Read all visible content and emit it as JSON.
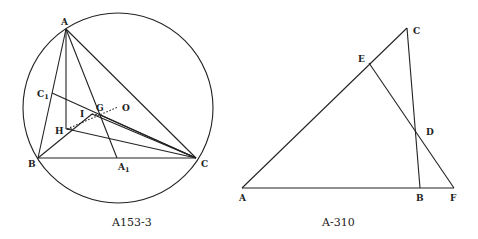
{
  "figures": [
    {
      "caption": "A153-3",
      "description": "Triangle ABC inscribed in circle with orthocenter H, incenter I, centroid G, circumcenter O, and cevians A-A1, C-C1",
      "circle": {
        "cx": 118,
        "cy": 108,
        "r": 95
      },
      "points": {
        "A": {
          "label": "A",
          "x": 66,
          "y": 29
        },
        "B": {
          "label": "B",
          "x": 38,
          "y": 158
        },
        "C": {
          "label": "C",
          "x": 196,
          "y": 158
        },
        "A1": {
          "label": "A",
          "sub": "1",
          "x": 117,
          "y": 158
        },
        "C1": {
          "label": "C",
          "sub": "1",
          "x": 52,
          "y": 93
        },
        "H": {
          "label": "H",
          "x": 67,
          "y": 129
        },
        "I": {
          "label": "I",
          "x": 92,
          "y": 114
        },
        "G": {
          "label": "G",
          "x": 100,
          "y": 115
        },
        "O": {
          "label": "O",
          "x": 118,
          "y": 107
        }
      }
    },
    {
      "caption": "A-310",
      "description": "Triangle ABC with transversal line E-D-F",
      "points": {
        "A": {
          "label": "A",
          "x": 242,
          "y": 188
        },
        "B": {
          "label": "B",
          "x": 420,
          "y": 188
        },
        "F": {
          "label": "F",
          "x": 454,
          "y": 188
        },
        "C": {
          "label": "C",
          "x": 407,
          "y": 28
        },
        "E": {
          "label": "E",
          "x": 369,
          "y": 63
        },
        "D": {
          "label": "D",
          "x": 416,
          "y": 132
        }
      }
    }
  ]
}
